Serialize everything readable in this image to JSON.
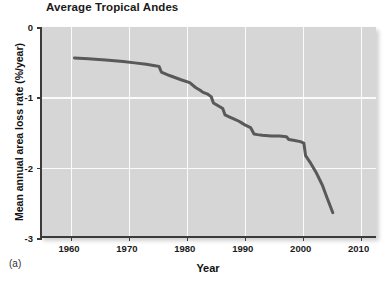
{
  "figure": {
    "panel_label": "(a)",
    "title": "Average Tropical Andes",
    "xlabel": "Year",
    "ylabel": "Mean annual area loss rate (%/year)"
  },
  "chart_data": {
    "type": "line",
    "title": "Average Tropical Andes",
    "xlabel": "Year",
    "ylabel": "Mean annual area loss rate (%/year)",
    "xlim": [
      1955,
      2013
    ],
    "ylim": [
      -3,
      0
    ],
    "xticks": [
      1960,
      1970,
      1980,
      1990,
      2000,
      2010
    ],
    "xtick_labels": [
      "1960",
      "1970",
      "1980",
      "1990",
      "2000",
      "2010"
    ],
    "yticks": [
      0,
      -1,
      -2,
      -3
    ],
    "ytick_labels": [
      "0",
      "-1",
      "-2",
      "-3"
    ],
    "grid": true,
    "legend": null,
    "line_color": "#595959",
    "line_width": 3,
    "background_color": "#d6d6d6",
    "series": [
      {
        "name": "Average Tropical Andes",
        "x": [
          1960.6,
          1963,
          1966,
          1969,
          1971,
          1973,
          1974.5,
          1975.2,
          1975.6,
          1977,
          1979,
          1980.5,
          1981.5,
          1982.3,
          1982.8,
          1983.5,
          1984.2,
          1984.6,
          1985.4,
          1986.2,
          1986.6,
          1987.4,
          1988.2,
          1989,
          1989.6,
          1990.2,
          1991,
          1991.6,
          1992.2,
          1993,
          1994.6,
          1996,
          1997.2,
          1997.6,
          1998.4,
          1999.6,
          2000.2,
          2000.5,
          2001.4,
          2002.4,
          2003.4,
          2004.3,
          2005.2
        ],
        "y": [
          -0.44,
          -0.45,
          -0.47,
          -0.49,
          -0.51,
          -0.53,
          -0.55,
          -0.56,
          -0.64,
          -0.69,
          -0.75,
          -0.79,
          -0.86,
          -0.9,
          -0.93,
          -0.95,
          -0.99,
          -1.08,
          -1.12,
          -1.16,
          -1.25,
          -1.28,
          -1.31,
          -1.34,
          -1.37,
          -1.4,
          -1.43,
          -1.52,
          -1.53,
          -1.54,
          -1.55,
          -1.55,
          -1.56,
          -1.6,
          -1.61,
          -1.63,
          -1.65,
          -1.83,
          -1.94,
          -2.08,
          -2.25,
          -2.45,
          -2.64
        ]
      }
    ]
  }
}
